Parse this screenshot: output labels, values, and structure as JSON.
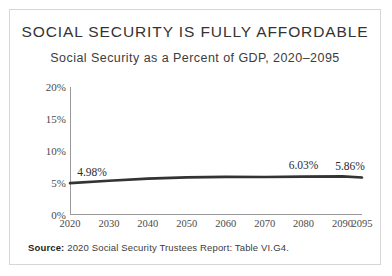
{
  "card": {
    "title": "SOCIAL SECURITY IS FULLY AFFORDABLE",
    "subtitle": "Social Security as a Percent of GDP, 2020–2095",
    "source_prefix": "Source:",
    "source_text": " 2020 Social Security Trustees Report: Table VI.G4."
  },
  "chart_data": {
    "type": "line",
    "title": "SOCIAL SECURITY IS FULLY AFFORDABLE",
    "subtitle": "Social Security as a Percent of GDP, 2020–2095",
    "xlabel": "",
    "ylabel": "",
    "ylim": [
      0,
      20
    ],
    "xlim": [
      2020,
      2095
    ],
    "grid": false,
    "legend": "none",
    "line_color": "#333333",
    "ytick_labels": [
      "0%",
      "5%",
      "10%",
      "15%",
      "20%"
    ],
    "ytick_values": [
      0,
      5,
      10,
      15,
      20
    ],
    "xtick_labels": [
      "2020",
      "2030",
      "2040",
      "2050",
      "2060",
      "2070",
      "2080",
      "2090",
      "2095"
    ],
    "xtick_values": [
      2020,
      2030,
      2040,
      2050,
      2060,
      2070,
      2080,
      2090,
      2095
    ],
    "x": [
      2020,
      2030,
      2040,
      2050,
      2060,
      2070,
      2080,
      2090,
      2095
    ],
    "values": [
      4.98,
      5.35,
      5.68,
      5.88,
      5.95,
      5.93,
      6.0,
      6.03,
      5.86
    ],
    "annotations": [
      {
        "label": "4.98%",
        "x": 2020,
        "y": 4.98
      },
      {
        "label": "6.03%",
        "x": 2080,
        "y": 6.03
      },
      {
        "label": "5.86%",
        "x": 2095,
        "y": 5.86
      }
    ]
  }
}
